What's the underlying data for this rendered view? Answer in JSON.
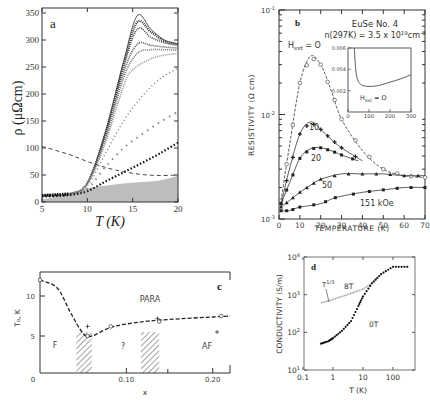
{
  "chart_data": [
    {
      "panel": "a",
      "type": "line",
      "xlabel": "T (K)",
      "ylabel": "ρ (μΩcm)",
      "xlim": [
        5,
        20
      ],
      "ylim": [
        0,
        350
      ],
      "xticks": [
        "5",
        "10",
        "15",
        "20"
      ],
      "yticks": [
        "0",
        "50",
        "100",
        "150",
        "200",
        "250",
        "300",
        "350"
      ],
      "series": [
        {
          "name": "curve-1 (solid)",
          "x": [
            5,
            8,
            10,
            12,
            14,
            15.5,
            17,
            18.5,
            20
          ],
          "values": [
            12,
            15,
            35,
            130,
            260,
            345,
            320,
            300,
            293
          ]
        },
        {
          "name": "curve-2",
          "x": [
            5,
            8,
            10,
            12,
            14,
            15.5,
            17,
            18.5,
            20
          ],
          "values": [
            12,
            15,
            35,
            128,
            255,
            333,
            315,
            298,
            292
          ]
        },
        {
          "name": "curve-3",
          "x": [
            5,
            8,
            10,
            12,
            14,
            15.5,
            17,
            18.5,
            20
          ],
          "values": [
            12,
            15,
            35,
            125,
            250,
            320,
            305,
            295,
            290
          ]
        },
        {
          "name": "curve-4",
          "x": [
            5,
            8,
            10,
            12,
            14,
            15.5,
            17,
            18.5,
            20
          ],
          "values": [
            12,
            15,
            34,
            120,
            240,
            292,
            290,
            287,
            285
          ]
        },
        {
          "name": "curve-5",
          "x": [
            5,
            8,
            10,
            12,
            14,
            15.5,
            17,
            18.5,
            20
          ],
          "values": [
            12,
            15,
            34,
            115,
            230,
            275,
            282,
            282,
            281
          ]
        },
        {
          "name": "curve-6",
          "x": [
            5,
            8,
            10,
            12,
            14,
            15,
            17,
            18.5,
            20
          ],
          "values": [
            12,
            15,
            33,
            110,
            215,
            245,
            265,
            272,
            275
          ]
        },
        {
          "name": "curve-7 (x)",
          "x": [
            5,
            8,
            10,
            12,
            14,
            16,
            18,
            20
          ],
          "values": [
            12,
            15,
            30,
            90,
            150,
            195,
            228,
            248
          ]
        },
        {
          "name": "curve-8 (x)",
          "x": [
            5,
            8,
            10,
            12,
            14,
            16,
            18,
            20
          ],
          "values": [
            12,
            15,
            25,
            65,
            100,
            125,
            148,
            167
          ]
        },
        {
          "name": "curve-9 (filled)",
          "x": [
            5,
            8,
            10,
            12,
            14,
            16,
            18,
            20
          ],
          "values": [
            10,
            13,
            20,
            38,
            55,
            72,
            90,
            110
          ]
        },
        {
          "name": "dashed",
          "x": [
            5,
            8,
            10,
            12,
            14,
            16,
            18,
            20
          ],
          "values": [
            103,
            88,
            75,
            64,
            56,
            51,
            49,
            50
          ]
        },
        {
          "name": "shaded-region",
          "x": [
            5,
            8,
            10,
            12,
            14,
            16,
            18,
            20
          ],
          "values": [
            5,
            15,
            25,
            30,
            34,
            37,
            40,
            48
          ]
        }
      ],
      "label": "a"
    },
    {
      "panel": "b",
      "type": "line",
      "title": "EuSe No. 4",
      "subtitle": "n(297K) = 3.5 x 10^19 cm^-3",
      "xlabel": "TEMPERATURE (K)",
      "ylabel": "RESISTIVITY (Ω cm)",
      "xlim": [
        0,
        70
      ],
      "ylim": [
        0.001,
        0.1
      ],
      "yscale": "log",
      "xticks": [
        "0",
        "10",
        "20",
        "30",
        "40",
        "50",
        "60",
        "70"
      ],
      "yticks": [
        "10^-3",
        "10^-2",
        "10^-1"
      ],
      "series": [
        {
          "name": "H_ext = 0",
          "x": [
            1,
            5,
            10,
            15,
            20,
            25,
            30,
            40,
            50,
            60,
            70
          ],
          "values": [
            0.0015,
            0.005,
            0.02,
            0.036,
            0.03,
            0.017,
            0.009,
            0.0045,
            0.003,
            0.0026,
            0.0025
          ]
        },
        {
          "name": "10",
          "x": [
            1,
            5,
            10,
            15,
            20,
            25,
            30,
            40
          ],
          "values": [
            0.0014,
            0.003,
            0.0065,
            0.0085,
            0.0072,
            0.0058,
            0.0048,
            0.0036
          ]
        },
        {
          "name": "20",
          "x": [
            1,
            5,
            10,
            15,
            20,
            25,
            30,
            38
          ],
          "values": [
            0.0014,
            0.0022,
            0.0038,
            0.0047,
            0.0048,
            0.0045,
            0.0041,
            0.0036
          ]
        },
        {
          "name": "50",
          "x": [
            1,
            5,
            10,
            15,
            20,
            30,
            40,
            50,
            60,
            70
          ],
          "values": [
            0.0013,
            0.0015,
            0.0018,
            0.0021,
            0.0024,
            0.0027,
            0.0027,
            0.0027,
            0.0026,
            0.0026
          ]
        },
        {
          "name": "151 kOe",
          "x": [
            1,
            5,
            10,
            20,
            27,
            40,
            50,
            60,
            70
          ],
          "values": [
            0.0012,
            0.0012,
            0.0013,
            0.0014,
            0.0016,
            0.0018,
            0.0019,
            0.002,
            0.002
          ]
        }
      ],
      "inset": {
        "xlim": [
          0,
          300
        ],
        "ylim": [
          0,
          0.006
        ],
        "xticks": [
          "0",
          "100",
          "200",
          "300"
        ],
        "yticks": [
          "0.002",
          "0.004",
          "0.006"
        ],
        "label": "H_ext = 0",
        "x": [
          30,
          40,
          60,
          100,
          150,
          200,
          250,
          300
        ],
        "values": [
          0.006,
          0.0035,
          0.0026,
          0.0024,
          0.0025,
          0.0028,
          0.0031,
          0.0035
        ]
      },
      "label": "b"
    },
    {
      "panel": "c",
      "type": "line",
      "xlabel": "x",
      "ylabel": "T₀, K",
      "xlim": [
        0,
        0.22
      ],
      "ylim": [
        0,
        13
      ],
      "xticks": [
        "0",
        "0.10",
        "0.20"
      ],
      "yticks": [
        "5",
        "10"
      ],
      "regions": [
        "PARA",
        "F",
        "?",
        "AF"
      ],
      "hatched_bands": [
        [
          0.042,
          0.06
        ],
        [
          0.117,
          0.138
        ]
      ],
      "series": [
        {
          "name": "phase boundary (dashed)",
          "x": [
            0,
            0.02,
            0.035,
            0.05,
            0.06,
            0.08,
            0.1,
            0.14,
            0.22
          ],
          "values": [
            12,
            11,
            8,
            5.3,
            5,
            6,
            6.5,
            7,
            7.5
          ]
        }
      ],
      "markers_circle": [
        [
          0,
          12
        ],
        [
          0.055,
          5
        ],
        [
          0.082,
          6.2
        ],
        [
          0.138,
          6.8
        ],
        [
          0.21,
          7.5
        ]
      ],
      "markers_plus": [
        [
          0.055,
          6.2
        ],
        [
          0.136,
          7.2
        ],
        [
          0.205,
          5.5
        ]
      ],
      "label": "c"
    },
    {
      "panel": "d",
      "type": "scatter",
      "xlabel": "T (K)",
      "ylabel": "CONDUCTIVITY (S/m)",
      "xscale": "log",
      "yscale": "log",
      "xlim": [
        0.1,
        300
      ],
      "ylim": [
        10,
        10000
      ],
      "xticks": [
        "0.1",
        "1",
        "10",
        "100"
      ],
      "yticks": [
        "10^1",
        "10^2",
        "10^3",
        "10^4"
      ],
      "annotations": [
        "T^1/3",
        "8T",
        "0T"
      ],
      "series": [
        {
          "name": "8T",
          "x": [
            0.4,
            1,
            3,
            10,
            20,
            30
          ],
          "values": [
            600,
            750,
            1000,
            1400,
            2000,
            2800
          ]
        },
        {
          "name": "0T",
          "x": [
            0.4,
            0.7,
            1,
            2,
            4,
            7,
            10,
            20,
            40,
            100,
            300
          ],
          "values": [
            50,
            58,
            70,
            110,
            200,
            500,
            900,
            2000,
            3500,
            5500,
            5500
          ]
        }
      ],
      "label": "d"
    }
  ]
}
